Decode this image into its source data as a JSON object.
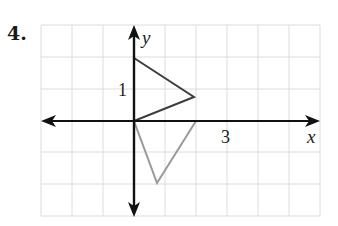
{
  "problem": {
    "number": "4."
  },
  "graph": {
    "axis_labels": {
      "x": "x",
      "y": "y"
    },
    "tick_labels": {
      "y_one": "1",
      "x_three": "3"
    },
    "colors": {
      "grid": "#dcdcdc",
      "axes": "#111111",
      "triangle_dark": "#3c3c3c",
      "triangle_light": "#9a9a9a"
    },
    "shapes": [
      {
        "name": "dark-triangle",
        "vertices": [
          [
            0,
            0
          ],
          [
            0,
            2
          ],
          [
            2,
            0.75
          ]
        ]
      },
      {
        "name": "light-triangle",
        "vertices": [
          [
            0,
            0
          ],
          [
            2,
            0
          ],
          [
            0.75,
            -2
          ]
        ]
      }
    ],
    "grid_range": {
      "x": [
        -3,
        6
      ],
      "y": [
        -3,
        3
      ]
    }
  }
}
